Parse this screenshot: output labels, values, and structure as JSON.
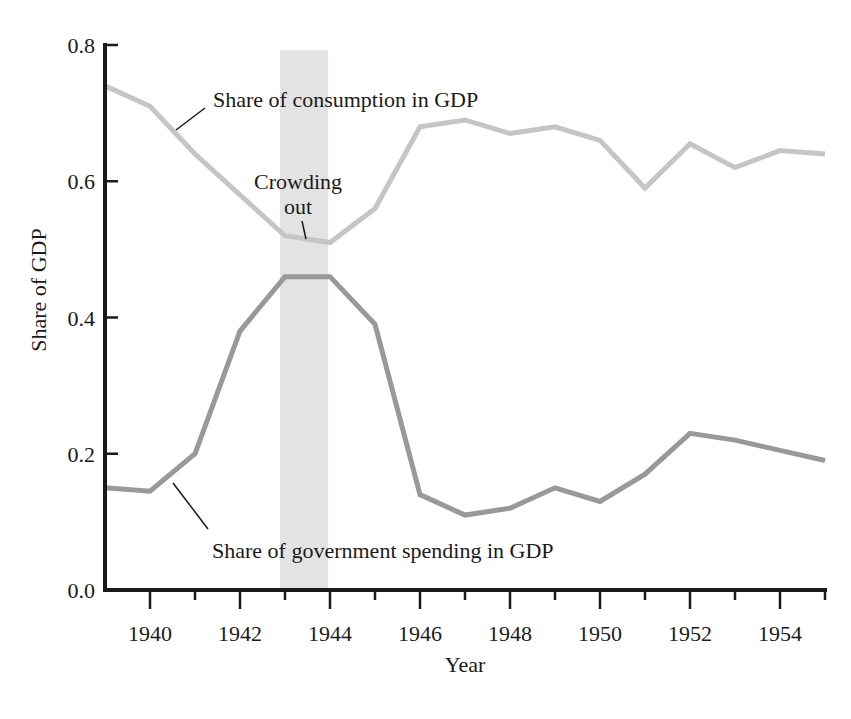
{
  "chart_data": {
    "type": "line",
    "title": "",
    "xlabel": "Year",
    "ylabel": "Share of GDP",
    "xlim": [
      1939,
      1955
    ],
    "ylim": [
      0.0,
      0.8
    ],
    "grid": false,
    "legend": "none (inline line labels)",
    "x": [
      1939,
      1940,
      1941,
      1942,
      1943,
      1944,
      1945,
      1946,
      1947,
      1948,
      1949,
      1950,
      1951,
      1952,
      1953,
      1954,
      1955
    ],
    "series": [
      {
        "name": "Share of consumption in GDP",
        "color": "#c5c5c5",
        "values": [
          0.74,
          0.71,
          0.64,
          0.58,
          0.52,
          0.51,
          0.56,
          0.68,
          0.69,
          0.67,
          0.68,
          0.66,
          0.59,
          0.655,
          0.62,
          0.645,
          0.64
        ]
      },
      {
        "name": "Share of government spending in GDP",
        "color": "#999999",
        "values": [
          0.15,
          0.145,
          0.2,
          0.38,
          0.46,
          0.46,
          0.39,
          0.14,
          0.11,
          0.12,
          0.15,
          0.13,
          0.17,
          0.23,
          0.22,
          0.205,
          0.19
        ]
      }
    ],
    "yticks": [
      0.0,
      0.2,
      0.4,
      0.6,
      0.8
    ],
    "ytick_labels": [
      "0.0",
      "0.2",
      "0.4",
      "0.6",
      "0.8"
    ],
    "xticks_major": [
      1940,
      1942,
      1944,
      1946,
      1948,
      1950,
      1952,
      1954
    ],
    "xticks_minor": [
      1941,
      1943,
      1945,
      1947,
      1949,
      1951,
      1953,
      1955
    ],
    "highlight_band": {
      "label": "Crowding out",
      "x_from": 1942.89,
      "x_to": 1943.96,
      "color": "#e3e3e3"
    },
    "annotations": {
      "consumption_label": "Share of consumption in GDP",
      "crowding_label_line1": "Crowding",
      "crowding_label_line2": "out",
      "government_label": "Share of government spending in GDP"
    },
    "axis_color": "#1a1a1a"
  }
}
